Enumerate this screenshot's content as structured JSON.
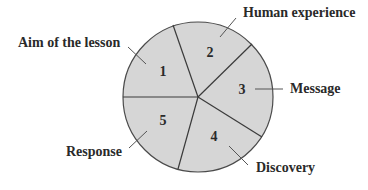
{
  "diagram": {
    "colors": {
      "fill": "#d6d6d6",
      "stroke": "#4a4a4a",
      "text": "#2a2a2a"
    },
    "segments": [
      {
        "number": "1",
        "label": "Aim of the lesson"
      },
      {
        "number": "2",
        "label": "Human experience"
      },
      {
        "number": "3",
        "label": "Message"
      },
      {
        "number": "4",
        "label": "Discovery"
      },
      {
        "number": "5",
        "label": "Response"
      }
    ]
  }
}
